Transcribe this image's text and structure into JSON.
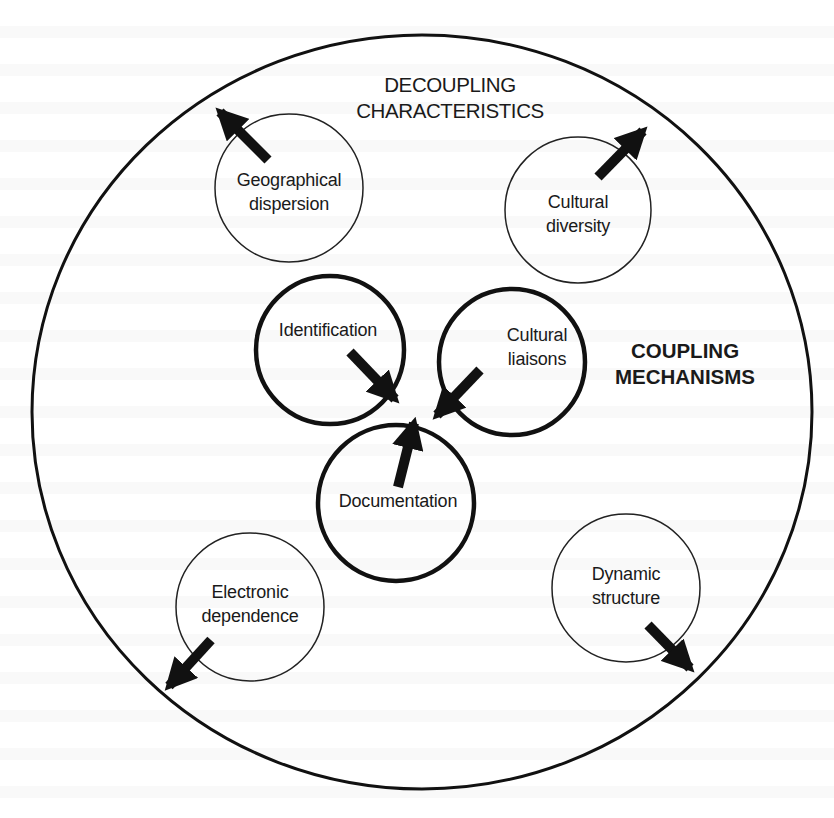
{
  "diagram": {
    "title_decoupling": {
      "lines": [
        "DECOUPLING",
        "CHARACTERISTICS"
      ]
    },
    "title_coupling": {
      "lines": [
        "COUPLING",
        "MECHANISMS"
      ]
    },
    "outer_boundary": {
      "cx": 422,
      "cy": 412,
      "rx": 390,
      "ry": 377
    },
    "decoupling_nodes": [
      {
        "id": "geographical-dispersion",
        "lines": [
          "Geographical",
          "dispersion"
        ],
        "cx": 289,
        "cy": 188,
        "r": 74,
        "arrow_direction": "outward-up-left"
      },
      {
        "id": "cultural-diversity",
        "lines": [
          "Cultural",
          "diversity"
        ],
        "cx": 578,
        "cy": 210,
        "r": 73,
        "arrow_direction": "outward-up-right"
      },
      {
        "id": "electronic-dependence",
        "lines": [
          "Electronic",
          "dependence"
        ],
        "cx": 250,
        "cy": 607,
        "r": 74,
        "arrow_direction": "outward-down-left"
      },
      {
        "id": "dynamic-structure",
        "lines": [
          "Dynamic",
          "structure"
        ],
        "cx": 626,
        "cy": 588,
        "r": 74,
        "arrow_direction": "outward-down-right"
      }
    ],
    "coupling_nodes": [
      {
        "id": "identification",
        "lines": [
          "Identification"
        ],
        "cx": 330,
        "cy": 350,
        "r": 74,
        "arrow_direction": "inward"
      },
      {
        "id": "cultural-liaisons",
        "lines": [
          "Cultural",
          "liaisons"
        ],
        "cx": 512,
        "cy": 362,
        "r": 73,
        "arrow_direction": "inward"
      },
      {
        "id": "documentation",
        "lines": [
          "Documentation"
        ],
        "cx": 396,
        "cy": 503,
        "r": 78,
        "arrow_direction": "inward"
      }
    ],
    "colors": {
      "stroke": "#111111",
      "background": "#ffffff",
      "text": "#1a1a1a"
    }
  }
}
